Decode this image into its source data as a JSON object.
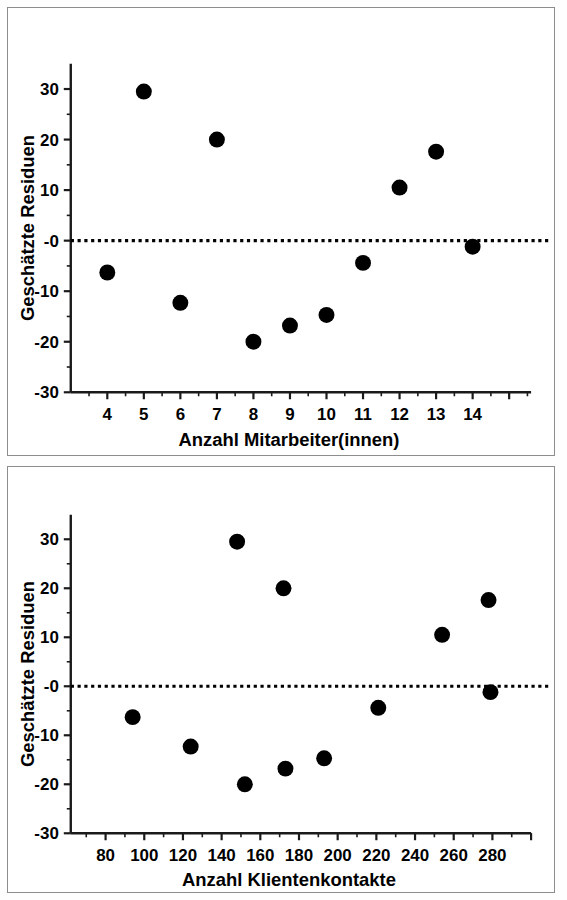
{
  "figure": {
    "background_color": "#fefefe",
    "panel_border_color": "#8d8d8d",
    "marker_color": "#000000",
    "axis_color": "#1a1a1a",
    "reference_line_color": "#000000"
  },
  "chart_data": [
    {
      "type": "scatter",
      "panel": "top",
      "title": "",
      "xlabel": "Anzahl Mitarbeiter(innen)",
      "ylabel": "Geschätzte Residuen",
      "xlim": [
        3.0,
        15.6
      ],
      "ylim": [
        -30,
        35
      ],
      "xticks": [
        4,
        5,
        6,
        7,
        8,
        9,
        10,
        11,
        12,
        13,
        14
      ],
      "xticklabels": [
        "4",
        "5",
        "6",
        "7",
        "8",
        "9",
        "10",
        "11",
        "12",
        "13",
        "14"
      ],
      "yticks": [
        30,
        20,
        10,
        0,
        -10,
        -20,
        -30
      ],
      "yticklabels": [
        "30",
        "20",
        "10",
        "-0",
        "-10",
        "-20",
        "-30"
      ],
      "minor_ticks": true,
      "grid": false,
      "legend": null,
      "reference_line": {
        "y": 0,
        "style": "dotted",
        "label": ""
      },
      "x": [
        4,
        5,
        6,
        7,
        8,
        9,
        10,
        11,
        12,
        13,
        14
      ],
      "y": [
        -6.3,
        29.5,
        -12.3,
        20.0,
        -20.0,
        -16.8,
        -14.7,
        -4.4,
        10.5,
        17.6,
        -1.2
      ],
      "points": [
        {
          "x": 4,
          "y": -6.3
        },
        {
          "x": 5,
          "y": 29.5
        },
        {
          "x": 6,
          "y": -12.3
        },
        {
          "x": 7,
          "y": 20.0
        },
        {
          "x": 8,
          "y": -20.0
        },
        {
          "x": 9,
          "y": -16.8
        },
        {
          "x": 10,
          "y": -14.7
        },
        {
          "x": 11,
          "y": -4.4
        },
        {
          "x": 12,
          "y": 10.5
        },
        {
          "x": 13,
          "y": 17.6
        },
        {
          "x": 14,
          "y": -1.2
        }
      ]
    },
    {
      "type": "scatter",
      "panel": "bottom",
      "title": "",
      "xlabel": "Anzahl Klientenkontakte",
      "ylabel": "Geschätzte Residuen",
      "xlim": [
        62,
        300
      ],
      "ylim": [
        -30,
        35
      ],
      "xticks": [
        80,
        100,
        120,
        140,
        160,
        180,
        200,
        220,
        240,
        260,
        280
      ],
      "xticklabels": [
        "80",
        "100",
        "120",
        "140",
        "160",
        "180",
        "200",
        "220",
        "240",
        "260",
        "280"
      ],
      "yticks": [
        30,
        20,
        10,
        0,
        -10,
        -20,
        -30
      ],
      "yticklabels": [
        "30",
        "20",
        "10",
        "-0",
        "-10",
        "-20",
        "-30"
      ],
      "minor_ticks": true,
      "grid": false,
      "legend": null,
      "reference_line": {
        "y": 0,
        "style": "dotted",
        "label": ""
      },
      "x": [
        94,
        124,
        148,
        152,
        172,
        173,
        193,
        221,
        254,
        278,
        279
      ],
      "y": [
        -6.3,
        -12.3,
        29.5,
        -20.0,
        20.0,
        -16.8,
        -14.7,
        -4.4,
        10.5,
        17.6,
        -1.2
      ],
      "points": [
        {
          "x": 94,
          "y": -6.3
        },
        {
          "x": 124,
          "y": -12.3
        },
        {
          "x": 148,
          "y": 29.5
        },
        {
          "x": 152,
          "y": -20.0
        },
        {
          "x": 172,
          "y": 20.0
        },
        {
          "x": 173,
          "y": -16.8
        },
        {
          "x": 193,
          "y": -14.7
        },
        {
          "x": 221,
          "y": -4.4
        },
        {
          "x": 254,
          "y": 10.5
        },
        {
          "x": 278,
          "y": 17.6
        },
        {
          "x": 279,
          "y": -1.2
        }
      ]
    }
  ]
}
